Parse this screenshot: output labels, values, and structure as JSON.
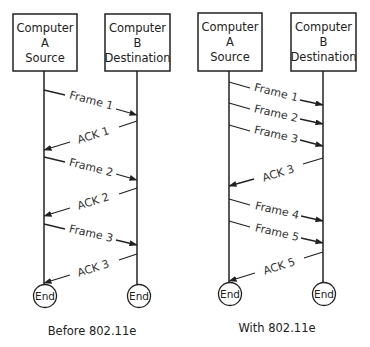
{
  "diagrams": [
    {
      "caption": "Before 802.11e",
      "source": {
        "line1": "Computer",
        "line2": "A",
        "line3": "Source"
      },
      "destination": {
        "line1": "Computer",
        "line2": "B",
        "line3": "Destination"
      },
      "messages": [
        {
          "label": "Frame 1",
          "direction": "A-to-B"
        },
        {
          "label": "ACK 1",
          "direction": "B-to-A"
        },
        {
          "label": "Frame 2",
          "direction": "A-to-B"
        },
        {
          "label": "ACK 2",
          "direction": "B-to-A"
        },
        {
          "label": "Frame 3",
          "direction": "A-to-B"
        },
        {
          "label": "ACK 3",
          "direction": "B-to-A"
        }
      ],
      "end_label": "End"
    },
    {
      "caption": "With 802.11e",
      "source": {
        "line1": "Computer",
        "line2": "A",
        "line3": "Source"
      },
      "destination": {
        "line1": "Computer",
        "line2": "B",
        "line3": "Destination"
      },
      "messages": [
        {
          "label": "Frame 1",
          "direction": "A-to-B"
        },
        {
          "label": "Frame 2",
          "direction": "A-to-B"
        },
        {
          "label": "Frame 3",
          "direction": "A-to-B"
        },
        {
          "label": "ACK 3",
          "direction": "B-to-A"
        },
        {
          "label": "Frame 4",
          "direction": "A-to-B"
        },
        {
          "label": "Frame 5",
          "direction": "A-to-B"
        },
        {
          "label": "ACK 5",
          "direction": "B-to-A"
        }
      ],
      "end_label": "End"
    }
  ]
}
